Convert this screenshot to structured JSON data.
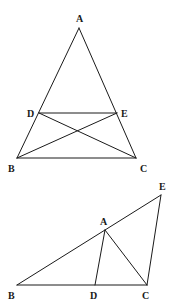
{
  "figures": [
    {
      "name": "figure-1",
      "description": "Triangle ABC with segment DE parallel to BC, and diagonals DC and EB",
      "points": [
        "A",
        "B",
        "C",
        "D",
        "E"
      ],
      "segments": [
        [
          "A",
          "B"
        ],
        [
          "A",
          "C"
        ],
        [
          "B",
          "C"
        ],
        [
          "D",
          "E"
        ],
        [
          "D",
          "C"
        ],
        [
          "E",
          "B"
        ]
      ],
      "labels": {
        "A": "A",
        "B": "B",
        "C": "C",
        "D": "D",
        "E": "E"
      }
    },
    {
      "name": "figure-2",
      "description": "Triangle with B, D, C collinear; A on segment BE; segments AD, AC, EC",
      "points": [
        "B",
        "D",
        "C",
        "A",
        "E"
      ],
      "segments": [
        [
          "B",
          "C"
        ],
        [
          "B",
          "E"
        ],
        [
          "E",
          "C"
        ],
        [
          "A",
          "D"
        ],
        [
          "A",
          "C"
        ]
      ],
      "labels": {
        "A": "A",
        "B": "B",
        "C": "C",
        "D": "D",
        "E": "E"
      }
    }
  ],
  "colors": {
    "stroke": "#1a1a1a",
    "background": "#ffffff"
  }
}
